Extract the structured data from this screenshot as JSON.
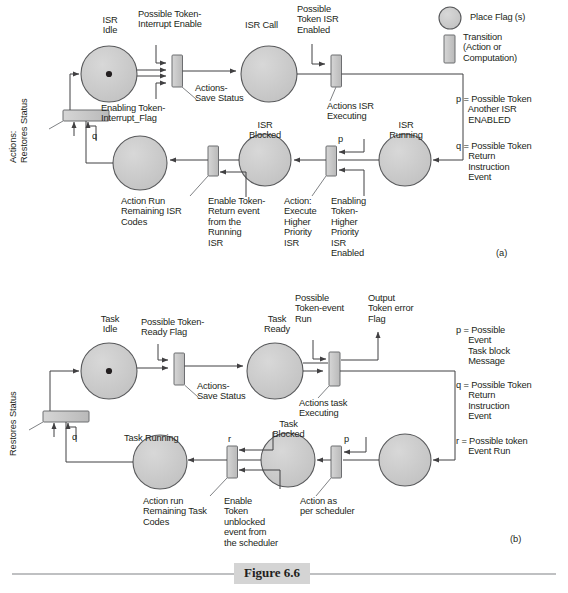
{
  "figure": {
    "caption": "Figure 6.6",
    "panel_a_label": "(a)",
    "panel_b_label": "(b)"
  },
  "colors": {
    "place_fill": "#c9c9c9",
    "place_stroke": "#58595b",
    "transition_fill": "#c9c9c9",
    "transition_stroke": "#6d6e71",
    "line": "#414042",
    "caption_band": "#d4d4d4",
    "text": "#231f20"
  },
  "legend": {
    "place_label": "Place Flag (s)",
    "transition_label": "Transition\n(Action or\nComputation)",
    "a_p": "p = Possible Token\n     Another ISR\n     ENABLED",
    "a_q": "q = Possible Token\n     Return\n     Instruction\n     Event",
    "b_p": "p = Possible\n     Event\n     Task block\n     Message",
    "b_q": "q = Possible Token\n     Return\n     Instruction\n     Event",
    "b_r": "r = Possible token\n     Event Run"
  },
  "panel_a": {
    "places": [
      {
        "id": "isr-idle",
        "label": "ISR\nIdle",
        "has_token": true
      },
      {
        "id": "isr-call",
        "label": "ISR Call",
        "has_token": false
      },
      {
        "id": "isr-blocked",
        "label": "ISR\nBlocked",
        "has_token": false
      },
      {
        "id": "isr-running",
        "label": "ISR\nRunning",
        "has_token": false
      },
      {
        "id": "isr-remaining",
        "label": "",
        "has_token": false
      }
    ],
    "labels": {
      "isr_idle": "ISR\nIdle",
      "isr_call": "ISR Call",
      "isr_blocked": "ISR\nBlocked",
      "isr_running": "ISR\nRunning",
      "possible_token_interrupt_enable": "Possible Token-\nInterrupt Enable",
      "possible_token_isr_enabled": "Possible\nToken ISR\nEnabled",
      "enabling_token_interrupt_flag": "Enabling Token-\nInterrupt_Flag",
      "actions_save_status": "Actions-\nSave Status",
      "actions_isr_executing": "Actions ISR\nExecuting",
      "action_run_remaining": "Action Run\nRemaining ISR\nCodes",
      "enable_token_return_event": "Enable Token-\nReturn event\nfrom the\nRunning\nISR",
      "action_execute_higher": "Action:\nExecute\nHigher\nPriority\nISR",
      "enabling_token_higher": "Enabling\nToken-\nHigher\nPriority\nISR\nEnabled",
      "actions_restores_status": "Actions:\nRestores Status",
      "q_marker": "q",
      "p_marker": "p"
    }
  },
  "panel_b": {
    "labels": {
      "task_idle": "Task\nIdle",
      "task_ready": "Task\nReady",
      "task_blocked": "Task\nBlocked",
      "task_running": "Task Running",
      "possible_token_ready_flag": "Possible Token-\nReady Flag",
      "possible_token_event_run": "Possible\nToken-event\nRun",
      "output_token_error_flag": "Output\nToken error\nFlag",
      "actions_save_status": "Actions-\nSave Status",
      "actions_task_executing": "Actions task\nExecuting",
      "action_run_remaining": "Action run\nRemaining Task\nCodes",
      "enable_token_unblocked": "Enable\nToken\nunblocked\nevent from\nthe scheduler",
      "action_as_per_scheduler": "Action as\nper scheduler",
      "restores_status": "Restores Status",
      "q_marker": "q",
      "p_marker": "p",
      "r_marker": "r"
    }
  }
}
